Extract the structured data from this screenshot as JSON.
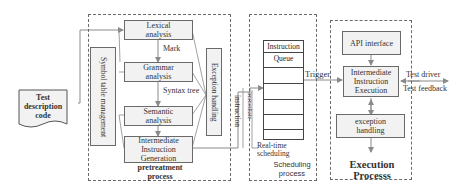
{
  "diagram": {
    "input": {
      "label": "Test description code"
    },
    "pretreatment": {
      "title": "pretreatment process",
      "steps": [
        {
          "label": "Lexical analysis"
        },
        {
          "label": "Grammar analysis"
        },
        {
          "label": "Semantic analysis"
        },
        {
          "label": "Intermediate Instruction Generation"
        }
      ],
      "edge_labels": {
        "mark": "Mark",
        "syntax_tree": "Syntax tree"
      },
      "symbol_table": "Symbol table management",
      "exception": "Exception handling"
    },
    "links": {
      "instruction": "instruction",
      "immediate": "immediate",
      "trigger": "Trigger",
      "test_driver": "Test driver",
      "test_feedback": "Test feedback",
      "realtime": "Real-time scheduling"
    },
    "scheduling": {
      "title": "Scheduling process",
      "queue_title_1": "Instruction",
      "queue_title_2": "Queue"
    },
    "execution": {
      "title": "Execution Processs",
      "api": "API interface",
      "exec": "Intermediate Instruction Execution",
      "exception": "exception handling"
    },
    "colors": {
      "line": "#6a6a6a",
      "box_fill": "#f2f2f2"
    }
  }
}
